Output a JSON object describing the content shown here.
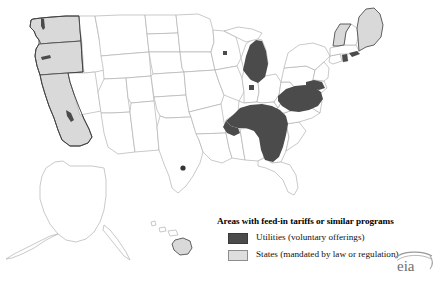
{
  "map": {
    "name": "United States feed-in tariff map",
    "background_color": "#ffffff",
    "state_border_color": "#b2b2b2",
    "includes_insets": [
      "Alaska",
      "Hawaii"
    ],
    "categories": {
      "utilities": {
        "label": "Utilities (voluntary offerings)",
        "color": "#4b4b4b"
      },
      "states": {
        "label": "States (mandated by law or regulation)",
        "color": "#d9d9d9"
      },
      "none": {
        "label": "No program",
        "color": "#ffffff"
      }
    },
    "states_mandated": [
      "Washington",
      "Oregon",
      "California",
      "Vermont",
      "Maine",
      "Hawaii"
    ],
    "utility_areas": [
      "Michigan",
      "Indiana",
      "Wisconsin",
      "Kentucky",
      "Tennessee",
      "Georgia",
      "Virginia",
      "North Carolina",
      "West Virginia",
      "Maryland",
      "Rhode Island",
      "Texas",
      "Washington",
      "Oregon",
      "California"
    ]
  },
  "legend": {
    "title": "Areas with feed-in tariffs or similar programs",
    "items": [
      {
        "swatch": "sw-utilities",
        "icon": "filled-square-dark",
        "label": "Utilities (voluntary offerings)"
      },
      {
        "swatch": "sw-states",
        "icon": "filled-square-light",
        "label": "States (mandated by law or regulation)"
      }
    ]
  },
  "branding": {
    "logo_text": "eia",
    "logo_name": "eia-logo"
  }
}
